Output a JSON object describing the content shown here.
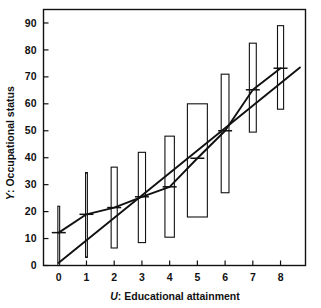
{
  "chart_data": {
    "type": "bar",
    "title": "",
    "subtitle": "",
    "xlabel": "U: Educational attainment",
    "ylabel": "Y: Occupational status",
    "xlabel_symbol": "U",
    "xlabel_text": ": Educational attainment",
    "ylabel_symbol": "Y",
    "ylabel_text": ": Occupational status",
    "categories": [
      "0",
      "1",
      "2",
      "3",
      "4",
      "5",
      "6",
      "7",
      "8"
    ],
    "x": [
      0,
      1,
      2,
      3,
      4,
      5,
      6,
      7,
      8
    ],
    "xlim": [
      -0.55,
      8.9
    ],
    "ylim": [
      0,
      95
    ],
    "xticks": [
      0,
      1,
      2,
      3,
      4,
      5,
      6,
      7,
      8
    ],
    "yticks": [
      0,
      10,
      20,
      30,
      40,
      50,
      60,
      70,
      80,
      90
    ],
    "xtick_labels": [
      "0",
      "1",
      "2",
      "3",
      "4",
      "5",
      "6",
      "7",
      "8"
    ],
    "ytick_labels": [
      "0",
      "10",
      "20",
      "30",
      "40",
      "50",
      "60",
      "70",
      "80",
      "90"
    ],
    "grid": false,
    "legend": "none",
    "frame": "box",
    "box_fill": "#ffffff",
    "box_stroke": "#111111",
    "line_color": "#111111",
    "background": "#ffffff",
    "boxes": [
      {
        "x": 0,
        "low": 0.0,
        "high": 22.0,
        "width": 0.035
      },
      {
        "x": 1,
        "low": 3.0,
        "high": 34.5,
        "width": 0.035
      },
      {
        "x": 2,
        "low": 6.5,
        "high": 36.5,
        "width": 0.22
      },
      {
        "x": 3,
        "low": 8.5,
        "high": 42.0,
        "width": 0.26
      },
      {
        "x": 4,
        "low": 10.5,
        "high": 48.0,
        "width": 0.34
      },
      {
        "x": 5,
        "low": 18.0,
        "high": 60.0,
        "width": 0.72
      },
      {
        "x": 6,
        "low": 27.0,
        "high": 71.0,
        "width": 0.28
      },
      {
        "x": 7,
        "low": 49.5,
        "high": 82.5,
        "width": 0.25
      },
      {
        "x": 8,
        "low": 58.0,
        "high": 89.0,
        "width": 0.22
      }
    ],
    "series": [
      {
        "name": "Conditional means (segmented line)",
        "type": "line",
        "marker": "horizontal-tick",
        "x": [
          0,
          1,
          2,
          3,
          4,
          5,
          6,
          7,
          8
        ],
        "values": [
          12.2,
          19.0,
          21.5,
          25.5,
          29.2,
          39.8,
          50.0,
          65.2,
          73.2
        ]
      },
      {
        "name": "Linear regression line",
        "type": "line",
        "marker": "none",
        "x": [
          0,
          8.7
        ],
        "values": [
          1.0,
          73.5
        ]
      }
    ]
  }
}
